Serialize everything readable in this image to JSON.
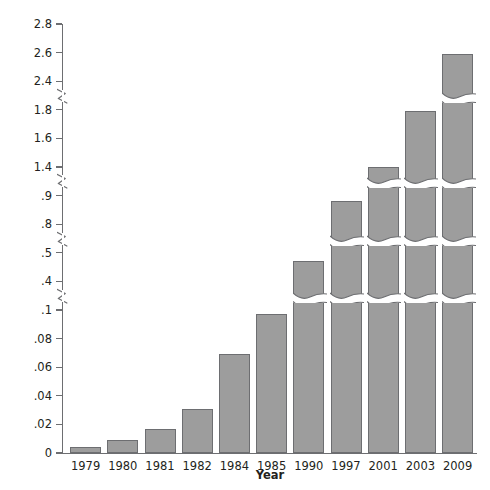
{
  "chart_data": {
    "type": "bar",
    "title": "",
    "xlabel": "Year",
    "ylabel": "Food Distribution (billions of pounds)",
    "categories": [
      "1979",
      "1980",
      "1981",
      "1982",
      "1984",
      "1985",
      "1990",
      "1997",
      "2001",
      "2003",
      "2009"
    ],
    "values": [
      0.004,
      0.009,
      0.017,
      0.031,
      0.069,
      0.097,
      0.47,
      0.88,
      1.4,
      1.79,
      2.59
    ],
    "y_tick_labels": [
      "0",
      ".02",
      ".04",
      ".06",
      ".08",
      ".1",
      ".4",
      ".5",
      ".8",
      ".9",
      "1.4",
      "1.6",
      "1.8",
      "2.4",
      "2.6",
      "2.8"
    ],
    "y_tick_values": [
      0,
      0.02,
      0.04,
      0.06,
      0.08,
      0.1,
      0.4,
      0.5,
      0.8,
      0.9,
      1.4,
      1.6,
      1.8,
      2.4,
      2.6,
      2.8
    ],
    "axis_breaks": [
      {
        "after_label": ".1",
        "before_label": ".4"
      },
      {
        "after_label": ".5",
        "before_label": ".8"
      },
      {
        "after_label": ".9",
        "before_label": "1.4"
      },
      {
        "after_label": "1.8",
        "before_label": "2.4"
      }
    ],
    "grid": false,
    "legend": "none",
    "bar_color": "#9d9d9d",
    "bar_border_color": "#6d6e71",
    "axis_color": "#6d6e71",
    "text_color": "#231f20"
  },
  "axis": {
    "y_title": "Food Distribution (billions of pounds)",
    "x_title": "Year"
  },
  "y_ticks": [
    {
      "label": "2.8"
    },
    {
      "label": "2.6"
    },
    {
      "label": "2.4"
    },
    {
      "label": "1.8"
    },
    {
      "label": "1.6"
    },
    {
      "label": "1.4"
    },
    {
      "label": ".9"
    },
    {
      "label": ".8"
    },
    {
      "label": ".5"
    },
    {
      "label": ".4"
    },
    {
      "label": ".1"
    },
    {
      "label": ".08"
    },
    {
      "label": ".06"
    },
    {
      "label": ".04"
    },
    {
      "label": ".02"
    },
    {
      "label": "0"
    }
  ],
  "x_ticks": [
    {
      "label": "1979"
    },
    {
      "label": "1980"
    },
    {
      "label": "1981"
    },
    {
      "label": "1982"
    },
    {
      "label": "1984"
    },
    {
      "label": "1985"
    },
    {
      "label": "1990"
    },
    {
      "label": "1997"
    },
    {
      "label": "2001"
    },
    {
      "label": "2003"
    },
    {
      "label": "2009"
    }
  ],
  "bars": [
    {
      "year": "1979",
      "value": "0.004"
    },
    {
      "year": "1980",
      "value": "0.009"
    },
    {
      "year": "1981",
      "value": "0.017"
    },
    {
      "year": "1982",
      "value": "0.031"
    },
    {
      "year": "1984",
      "value": "0.069"
    },
    {
      "year": "1985",
      "value": "0.097"
    },
    {
      "year": "1990",
      "value": "0.47"
    },
    {
      "year": "1997",
      "value": "0.88"
    },
    {
      "year": "2001",
      "value": "1.4"
    },
    {
      "year": "2003",
      "value": "1.79"
    },
    {
      "year": "2009",
      "value": "2.59"
    }
  ]
}
